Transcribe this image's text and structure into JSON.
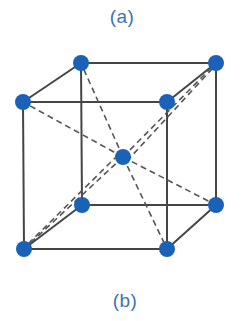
{
  "labels": {
    "top": "(a)",
    "bottom": "(b)"
  },
  "colors": {
    "atom": "#1a62b8",
    "edge": "#454545",
    "dash": "#555555",
    "label": "#3b74b3"
  },
  "structure": "body-centered cubic unit cell",
  "atoms": [
    {
      "id": "top-back-left",
      "x": 81,
      "y": 63
    },
    {
      "id": "top-back-right",
      "x": 216,
      "y": 63
    },
    {
      "id": "top-front-left",
      "x": 23,
      "y": 102
    },
    {
      "id": "top-front-right",
      "x": 167,
      "y": 102
    },
    {
      "id": "center",
      "x": 123,
      "y": 157
    },
    {
      "id": "bottom-back-left",
      "x": 82,
      "y": 205
    },
    {
      "id": "bottom-back-right",
      "x": 216,
      "y": 205
    },
    {
      "id": "bottom-front-left",
      "x": 24,
      "y": 249
    },
    {
      "id": "bottom-front-right",
      "x": 167,
      "y": 249
    }
  ]
}
